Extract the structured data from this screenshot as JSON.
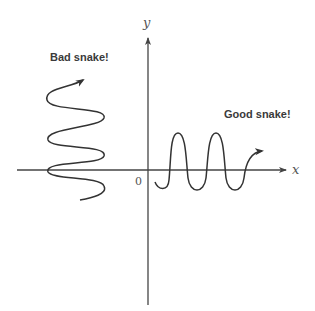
{
  "diagram": {
    "axes": {
      "x_label": "x",
      "y_label": "y",
      "origin_label": "0"
    },
    "annotations": {
      "bad_snake": "Bad snake!",
      "good_snake": "Good snake!"
    },
    "colors": {
      "stroke": "#333333",
      "axis": "#444444",
      "text": "#3a3a3a"
    }
  }
}
